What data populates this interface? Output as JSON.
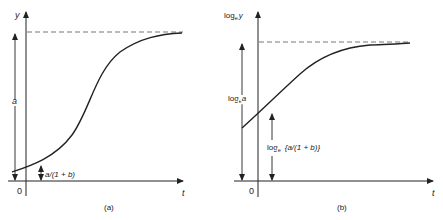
{
  "panels": [
    {
      "id": "a",
      "caption": "(a)",
      "y_axis_label": "y",
      "x_axis_label": "t",
      "origin_label": "0",
      "asymptote_label": "a",
      "intercept_label": "a/(1 + b)",
      "curve": "logistic"
    },
    {
      "id": "b",
      "caption": "(b)",
      "y_axis_label_base": "log",
      "y_axis_label_sub": "e",
      "y_axis_label_var": "y",
      "x_axis_label": "t",
      "origin_label": "0",
      "asymptote_label_base": "log",
      "asymptote_label_sub": "e",
      "asymptote_label_var": "a",
      "intercept_label_base": "log",
      "intercept_label_sub": "e",
      "intercept_label_var": "{a/(1 + b)}",
      "curve": "log-logistic"
    }
  ],
  "colors": {
    "ink": "#222222",
    "dash": "#555555"
  }
}
